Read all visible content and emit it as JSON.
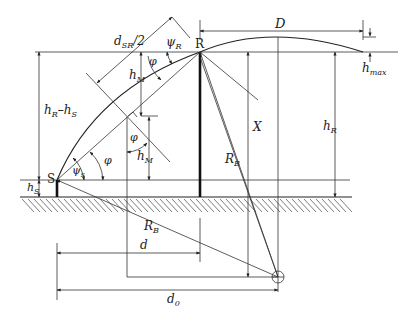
{
  "diagram": {
    "labels": {
      "d_sr_half": "d",
      "d_sr_half_sub": "SR",
      "d_sr_half_suffix": "/2",
      "psi_r": "ψ",
      "psi_r_sub": "R",
      "point_r": "R",
      "point_s": "S",
      "D": "D",
      "h_max": "h",
      "h_max_sub": "max",
      "h_m_upper": "h",
      "h_m_upper_sub": "M",
      "h_m_lower": "h",
      "h_m_lower_sub": "M",
      "phi_top": "φ",
      "phi_mid": "φ",
      "phi_s": "φ",
      "psi_s": "ψ",
      "psi_s_sub": "s",
      "h_r_minus_h_s": "h",
      "h_r_minus_h_s_sub1": "R",
      "h_r_minus_h_s_mid": "–h",
      "h_r_minus_h_s_sub2": "S",
      "h_s": "h",
      "h_s_sub": "S",
      "X": "X",
      "h_r": "h",
      "h_r_sub": "R",
      "r_b_upper": "R",
      "r_b_upper_sub": "B",
      "r_b_lower": "R",
      "r_b_lower_sub": "B",
      "d": "d",
      "d0": "d",
      "d0_sub": "0"
    },
    "colors": {
      "line": "#222222",
      "background": "#ffffff"
    }
  }
}
